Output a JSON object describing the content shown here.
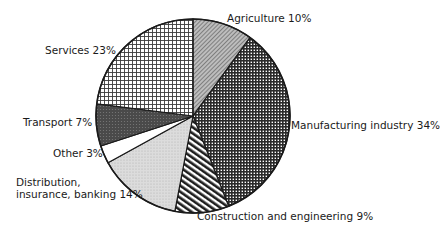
{
  "chart_data": {
    "type": "pie",
    "title": "",
    "start_angle_deg": 0,
    "direction": "clockwise",
    "slices": [
      {
        "label": "Agriculture",
        "value": 10,
        "pattern": "fine-diagonal",
        "color": "#9a9a9a"
      },
      {
        "label": "Manufacturing industry",
        "value": 34,
        "pattern": "dense-grid",
        "color": "#3a3a3a"
      },
      {
        "label": "Construction and engineering",
        "value": 9,
        "pattern": "diagonal-stripes",
        "color": "#2a2a2a"
      },
      {
        "label": "Distribution, insurance, banking",
        "value": 14,
        "pattern": "light-stipple",
        "color": "#d6d6d6"
      },
      {
        "label": "Other",
        "value": 3,
        "pattern": "none",
        "color": "#ffffff"
      },
      {
        "label": "Transport",
        "value": 7,
        "pattern": "dark-stipple",
        "color": "#505050"
      },
      {
        "label": "Services",
        "value": 23,
        "pattern": "open-grid",
        "color": "#ffffff"
      }
    ],
    "legend": "none (direct labels)"
  },
  "labels": {
    "agriculture": "Agriculture 10%",
    "manufacturing": "Manufacturing industry 34%",
    "construction": "Construction and engineering 9%",
    "distribution_line1": "Distribution,",
    "distribution_line2": "insurance, banking 14%",
    "other": "Other 3%",
    "transport": "Transport 7%",
    "services": "Services 23%"
  }
}
